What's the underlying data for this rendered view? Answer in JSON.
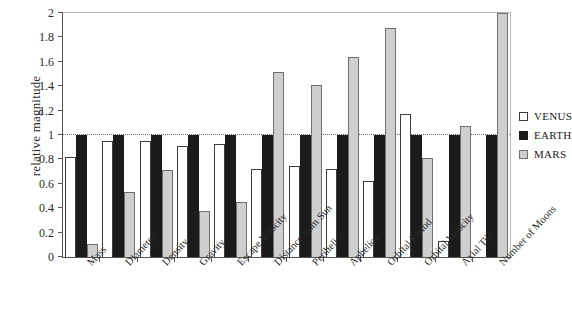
{
  "chart_data": {
    "type": "bar",
    "title": "",
    "xlabel": "",
    "ylabel": "relative magnitude",
    "ylim": [
      0,
      2
    ],
    "ytick_values": [
      0,
      0.2,
      0.4,
      0.6,
      0.8,
      1,
      1.2,
      1.4,
      1.6,
      1.8,
      2
    ],
    "ytick_labels": [
      "0",
      "0.2",
      "0.4",
      "0.6",
      "0.8",
      "1",
      "1.2",
      "1.4",
      "1.6",
      "1.8",
      "2"
    ],
    "grid": false,
    "reference_line": 1,
    "legend_position": "right",
    "categories": [
      "Mass",
      "Diameter",
      "Density",
      "Gravity",
      "Escape Velocity",
      "Distance from Sun",
      "Perihelion",
      "Aphelion",
      "Orbital Period",
      "Orbital Velocity",
      "Axial Tilt",
      "Number of Moons"
    ],
    "series": [
      {
        "name": "VENUS",
        "color": "#ffffff",
        "values": [
          0.82,
          0.95,
          0.95,
          0.91,
          0.93,
          0.72,
          0.75,
          0.72,
          0.62,
          1.17,
          0.13,
          0
        ]
      },
      {
        "name": "EARTH",
        "color": "#1b1b1b",
        "values": [
          1,
          1,
          1,
          1,
          1,
          1,
          1,
          1,
          1,
          1,
          1,
          1
        ]
      },
      {
        "name": "MARS",
        "color": "#cfcfcf",
        "values": [
          0.11,
          0.53,
          0.71,
          0.38,
          0.45,
          1.52,
          1.41,
          1.64,
          1.88,
          0.81,
          1.07,
          2
        ]
      }
    ]
  },
  "legend": {
    "items": [
      {
        "label": "VENUS",
        "key": "venus"
      },
      {
        "label": "EARTH",
        "key": "earth"
      },
      {
        "label": "MARS",
        "key": "mars"
      }
    ]
  }
}
